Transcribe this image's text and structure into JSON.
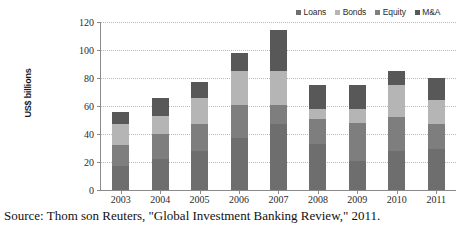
{
  "legend": {
    "position": "top-right",
    "items": [
      {
        "label": "Loans",
        "color": "#6e6e6e",
        "icon": "legend-square-icon"
      },
      {
        "label": "Bonds",
        "color": "#b5b5b5",
        "icon": "legend-square-icon"
      },
      {
        "label": "Equity",
        "color": "#7e7e7e",
        "icon": "legend-square-icon"
      },
      {
        "label": "M&A",
        "color": "#585858",
        "icon": "legend-square-icon"
      }
    ]
  },
  "axes": {
    "y_title": "US$ billions",
    "y_ticks": [
      "0",
      "20",
      "40",
      "60",
      "80",
      "100",
      "120"
    ],
    "x_ticks": [
      "2003",
      "2004",
      "2005",
      "2006",
      "2007",
      "2008",
      "2009",
      "2010",
      "2011"
    ]
  },
  "caption": "Source: Thom son Reuters, \"Global Investment Banking Review,\" 2011.",
  "chart_data": {
    "type": "bar",
    "stacked": true,
    "title": "",
    "subtitle": "",
    "xlabel": "",
    "ylabel": "US$ billions",
    "ylim": [
      0,
      120
    ],
    "ytick_step": 20,
    "grid": true,
    "legend_position": "top-right",
    "categories": [
      "2003",
      "2004",
      "2005",
      "2006",
      "2007",
      "2008",
      "2009",
      "2010",
      "2011"
    ],
    "series": [
      {
        "name": "Loans",
        "color": "#6e6e6e",
        "values": [
          17,
          22,
          28,
          37,
          47,
          33,
          21,
          28,
          29
        ]
      },
      {
        "name": "Equity",
        "color": "#7e7e7e",
        "values": [
          15,
          18,
          19,
          24,
          14,
          18,
          27,
          24,
          18
        ]
      },
      {
        "name": "Bonds",
        "color": "#b5b5b5",
        "values": [
          15,
          13,
          19,
          24,
          24,
          7,
          10,
          23,
          17
        ]
      },
      {
        "name": "M&A",
        "color": "#585858",
        "values": [
          9,
          13,
          11,
          13,
          29,
          17,
          17,
          10,
          16
        ]
      }
    ],
    "totals": [
      56,
      66,
      77,
      98,
      114,
      75,
      75,
      85,
      80
    ]
  }
}
